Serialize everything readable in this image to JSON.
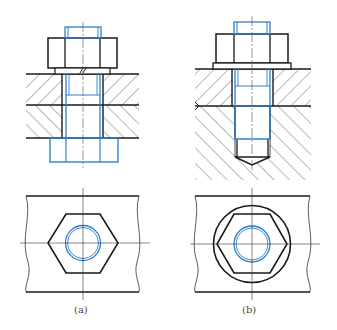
{
  "figure": {
    "type": "technical-drawing",
    "colors": {
      "outline": "#1a1a1a",
      "bolt": "#2f7fd0",
      "centerline": "#555555",
      "hatch": "#333333",
      "background": "#ffffff"
    }
  },
  "panels": [
    {
      "id": "a",
      "caption": "(a)",
      "description": "Through-bolt with nut and washer, two plates"
    },
    {
      "id": "b",
      "caption": "(b)",
      "description": "Stud/tap bolt into blind threaded hole with flanged nut"
    }
  ]
}
